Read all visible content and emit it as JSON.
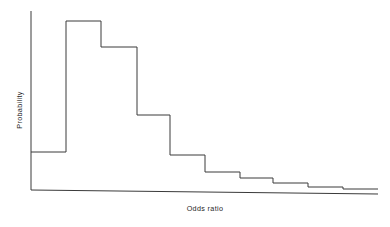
{
  "figure": {
    "title": "",
    "background_color": "#ffffff",
    "line_color": "#3a3a3a",
    "text_color": "#1f1f1f"
  },
  "axes": {
    "x_label": "Odds ratio",
    "y_label": "Probability",
    "x_ticks": [],
    "y_ticks": [],
    "grid": false
  },
  "chart_data": {
    "type": "bar",
    "title": "",
    "subtitle": "",
    "xlabel": "Odds ratio",
    "ylabel": "Probability",
    "legend": [],
    "grid": false,
    "axis_ticks_shown": false,
    "style": "step histogram outline, no fill, no tick marks, no tick labels",
    "categories": [
      "1",
      "2",
      "3",
      "4",
      "5",
      "6",
      "7",
      "8",
      "9",
      "10"
    ],
    "bin_edges": [
      0,
      1,
      2,
      3,
      4,
      5,
      6,
      7,
      8,
      9,
      10
    ],
    "values": [
      0.21,
      0.94,
      0.8,
      0.42,
      0.2,
      0.1,
      0.067,
      0.039,
      0.017,
      0.006
    ],
    "xlim": [
      0,
      10
    ],
    "ylim": [
      0,
      1
    ],
    "annotations": []
  },
  "geometry": {
    "note": "pixel coordinates used to reproduce the drawn outline",
    "y_axis": {
      "x": 31,
      "y_top": 11,
      "y_bottom": 190
    },
    "x_axis": {
      "x_left": 31,
      "y_left": 190,
      "x_right": 378,
      "y_right": 194
    },
    "steps": [
      {
        "x0": 31,
        "x1": 66,
        "y": 152
      },
      {
        "x0": 66,
        "x1": 101,
        "y": 21
      },
      {
        "x0": 101,
        "x1": 137,
        "y": 47
      },
      {
        "x0": 137,
        "x1": 170,
        "y": 115
      },
      {
        "x0": 170,
        "x1": 205,
        "y": 155
      },
      {
        "x0": 205,
        "x1": 240,
        "y": 172
      },
      {
        "x0": 240,
        "x1": 273,
        "y": 178
      },
      {
        "x0": 273,
        "x1": 308,
        "y": 183
      },
      {
        "x0": 308,
        "x1": 343,
        "y": 187
      },
      {
        "x0": 343,
        "x1": 378,
        "y": 189
      }
    ],
    "ylabel_anchor": {
      "x": 22,
      "y": 110,
      "rotation": -90
    },
    "xlabel_anchor": {
      "x": 205,
      "y": 211
    }
  }
}
